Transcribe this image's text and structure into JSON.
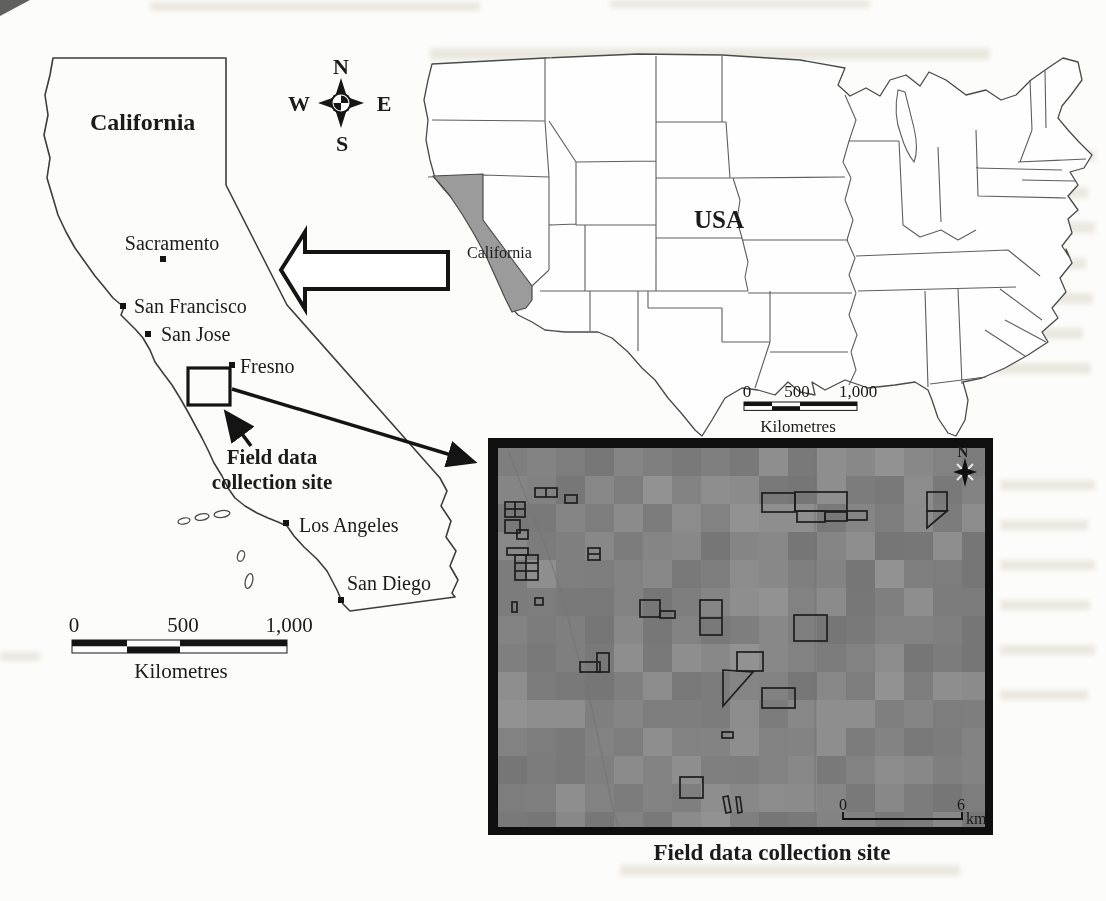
{
  "compass": {
    "n": "N",
    "e": "E",
    "s": "S",
    "w": "W"
  },
  "state_map": {
    "title": "California",
    "cities": [
      {
        "name": "Sacramento",
        "dot": [
          163,
          259
        ],
        "label": [
          172,
          250
        ],
        "anchor": "middle"
      },
      {
        "name": "San Francisco",
        "dot": [
          123,
          306
        ],
        "label": [
          134,
          313
        ],
        "anchor": "start"
      },
      {
        "name": "San Jose",
        "dot": [
          148,
          334
        ],
        "label": [
          161,
          341
        ],
        "anchor": "start"
      },
      {
        "name": "Fresno",
        "dot": [
          232,
          365
        ],
        "label": [
          240,
          373
        ],
        "anchor": "start"
      },
      {
        "name": "Los Angeles",
        "dot": [
          286,
          523
        ],
        "label": [
          299,
          532
        ],
        "anchor": "start"
      },
      {
        "name": "San Diego",
        "dot": [
          341,
          600
        ],
        "label": [
          347,
          590
        ],
        "anchor": "start"
      }
    ],
    "site_label_line1": "Field data",
    "site_label_line2": "collection site",
    "scale_bar": {
      "tick0": "0",
      "tick1": "500",
      "tick2": "1,000",
      "unit": "Kilometres"
    }
  },
  "usa_map": {
    "country_label": "USA",
    "highlight_label": "California",
    "highlight_color": "#9b9b9b",
    "scale_bar": {
      "tick0": "0",
      "tick1": "500",
      "tick2": "1,000",
      "unit": "Kilometres"
    }
  },
  "inset": {
    "north_label": "N",
    "caption": "Field data collection site",
    "scale_bar": {
      "start": "0",
      "end": "6",
      "unit": "km"
    },
    "background_color": "#8d8d8d",
    "field_polygons": [
      {
        "r": [
          535,
          488,
          22,
          9
        ],
        "dv": [
          546
        ]
      },
      {
        "r": [
          565,
          495,
          12,
          8
        ]
      },
      {
        "r": [
          505,
          502,
          20,
          15
        ],
        "dv": [
          515
        ],
        "dh": [
          509
        ]
      },
      {
        "r": [
          505,
          520,
          15,
          13
        ]
      },
      {
        "r": [
          517,
          530,
          11,
          9
        ]
      },
      {
        "r": [
          507,
          548,
          21,
          7
        ]
      },
      {
        "r": [
          515,
          555,
          23,
          25
        ],
        "dv": [
          526
        ],
        "dh": [
          563,
          571
        ]
      },
      {
        "r": [
          588,
          548,
          12,
          12
        ],
        "dh": [
          554
        ]
      },
      {
        "r": [
          512,
          602,
          5,
          10
        ]
      },
      {
        "r": [
          535,
          598,
          8,
          7
        ]
      },
      {
        "r": [
          640,
          600,
          20,
          17
        ]
      },
      {
        "r": [
          660,
          611,
          15,
          7
        ]
      },
      {
        "r": [
          700,
          600,
          22,
          35
        ],
        "dh": [
          618
        ]
      },
      {
        "r": [
          737,
          652,
          26,
          19
        ]
      },
      {
        "r": [
          762,
          688,
          33,
          20
        ]
      },
      {
        "r": [
          722,
          732,
          11,
          6
        ]
      },
      {
        "r": [
          680,
          777,
          23,
          21
        ]
      },
      {
        "r": [
          580,
          662,
          20,
          10
        ]
      },
      {
        "r": [
          597,
          653,
          12,
          19
        ]
      },
      {
        "r": [
          794,
          615,
          33,
          26
        ]
      },
      {
        "r": [
          762,
          493,
          33,
          19
        ]
      },
      {
        "r": [
          795,
          492,
          52,
          19
        ]
      },
      {
        "r": [
          797,
          511,
          28,
          11
        ]
      },
      {
        "r": [
          825,
          512,
          22,
          9
        ]
      },
      {
        "r": [
          847,
          511,
          20,
          9
        ]
      },
      {
        "r": [
          927,
          492,
          20,
          19
        ]
      }
    ],
    "field_paths": [
      "M723,670 L753,672 L723,706 Z",
      "M927,511 L947,511 L927,528 Z",
      "M723,797 l5,-1 l3,16 l-5,1 Z",
      "M736,797 l4,0 l2,15 l-4,1 Z"
    ],
    "roads": [
      "M508,450 L525,495 L545,545 L562,595 L575,645 L590,700 L602,755 L612,805 L618,826",
      "M815,451 L815,826"
    ]
  }
}
